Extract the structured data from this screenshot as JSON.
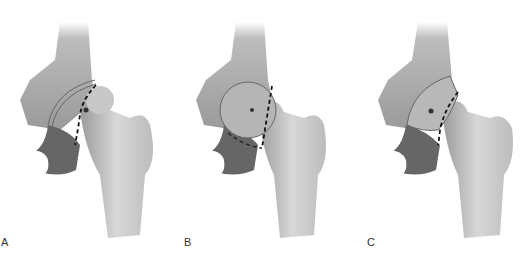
{
  "figure": {
    "panels": [
      {
        "label": "A",
        "description": "hip joint with dashed osteotomy line curving around femoral head"
      },
      {
        "label": "B",
        "description": "hip joint with straight dashed osteotomy line at femoral neck"
      },
      {
        "label": "C",
        "description": "hip joint with dashed osteotomy line, femoral head rotated"
      }
    ]
  },
  "colors": {
    "bone_light": "#d9d9d9",
    "bone_mid": "#a8a8a8",
    "bone_dark": "#555555",
    "outline": "#666666",
    "dashed_line": "#111111"
  }
}
